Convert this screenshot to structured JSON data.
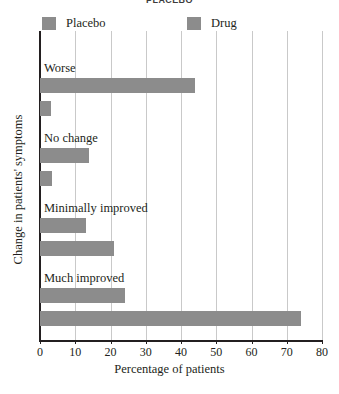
{
  "chart_data": {
    "type": "bar",
    "orientation": "horizontal",
    "title": "PLACEBO",
    "xlabel": "Percentage of patients",
    "ylabel": "Change in patients' symptoms",
    "categories": [
      "Worse",
      "No change",
      "Minimally improved",
      "Much improved"
    ],
    "series": [
      {
        "name": "Placebo",
        "values": [
          44,
          14,
          13,
          24
        ],
        "color": "#8c8c8c"
      },
      {
        "name": "Drug",
        "values": [
          3,
          3.5,
          21,
          74
        ],
        "color": "#8c8c8c"
      }
    ],
    "xlim": [
      0,
      80
    ],
    "xticks": [
      0,
      10,
      20,
      30,
      40,
      50,
      60,
      70,
      80
    ],
    "xtick_labels": [
      "0",
      "10",
      "20",
      "30",
      "40",
      "50",
      "60",
      "70",
      "80"
    ],
    "grid": true,
    "legend_position": "top-left"
  },
  "legend": {
    "entries": [
      {
        "label": "Placebo"
      },
      {
        "label": "Drug"
      }
    ]
  },
  "axes": {
    "x_title": "Percentage of patients",
    "y_title": "Change in patients' symptoms",
    "tick_labels": [
      "0",
      "10",
      "20",
      "30",
      "40",
      "50",
      "60",
      "70",
      "80"
    ]
  },
  "groups": [
    {
      "label": "Worse",
      "placebo": 44,
      "drug": 3
    },
    {
      "label": "No change",
      "placebo": 14,
      "drug": 3.5
    },
    {
      "label": "Minimally improved",
      "placebo": 13,
      "drug": 21
    },
    {
      "label": "Much improved",
      "placebo": 24,
      "drug": 74
    }
  ],
  "title": "PLACEBO",
  "source_caption": ""
}
